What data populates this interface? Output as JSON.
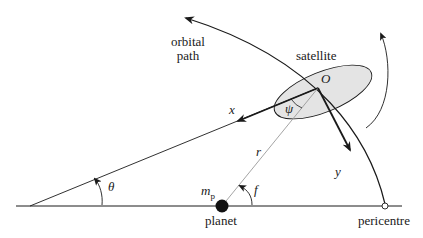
{
  "labels": {
    "orbital_path": [
      "orbital",
      "path"
    ],
    "satellite": "satellite",
    "origin": "O",
    "x_axis": "x",
    "y_axis": "y",
    "psi": "ψ",
    "r": "r",
    "theta": "θ",
    "f": "f",
    "mp_main": "m",
    "mp_sub": "p",
    "planet": "planet",
    "pericentre": "pericentre"
  },
  "colors": {
    "line": "#1a1a1a",
    "gray_line": "#9a9a9a",
    "satellite_fill": "#e4e4e4"
  }
}
